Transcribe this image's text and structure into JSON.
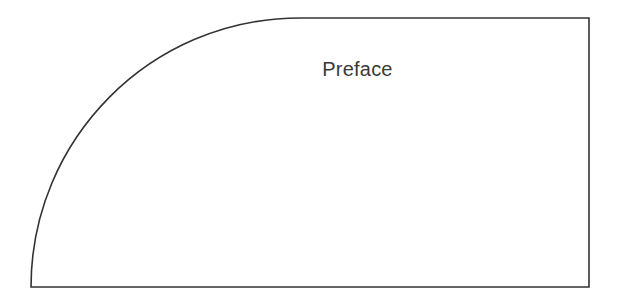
{
  "diagram": {
    "title": "Preface",
    "shape": "quarter-round-rectangle",
    "stroke_color": "#333333",
    "fill_color": "#ffffff"
  }
}
